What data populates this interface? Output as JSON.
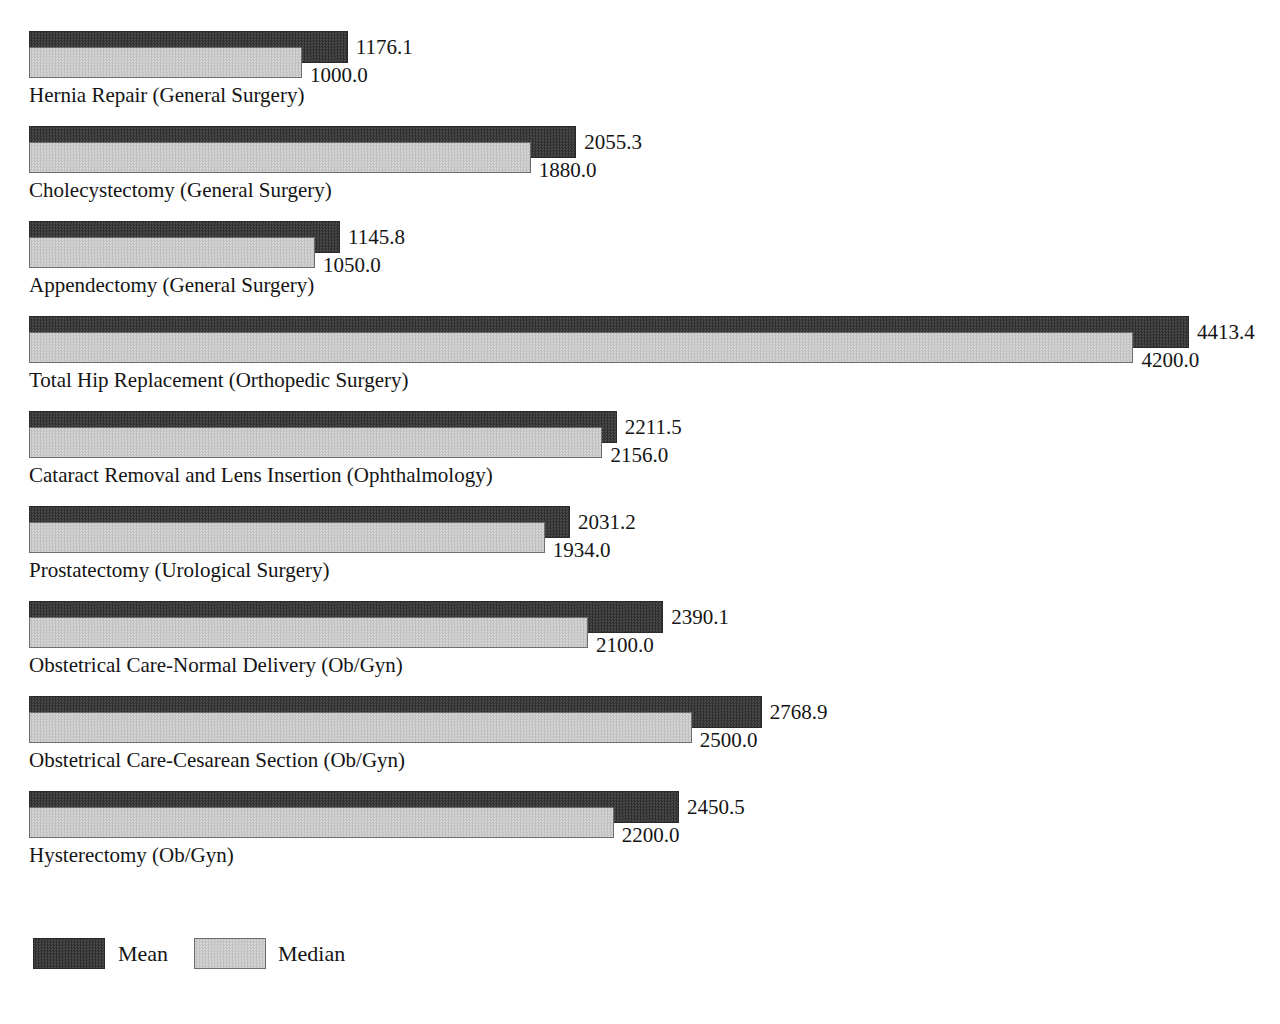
{
  "chart_data": {
    "type": "bar",
    "orientation": "horizontal",
    "title": "Mean and Median Charges",
    "subtitle": "",
    "xlabel": "",
    "ylabel": "",
    "grid": false,
    "legend_position": "bottom-left",
    "xlim": [
      0,
      4413.4
    ],
    "categories": [
      "Hernia Repair (General Surgery)",
      "Cholecystectomy (General Surgery)",
      "Appendectomy (General Surgery)",
      "Total Hip Replacement (Orthopedic Surgery)",
      "Cataract Removal and Lens Insertion (Ophthalmology)",
      "Prostatectomy (Urological Surgery)",
      "Obstetrical Care-Normal Delivery (Ob/Gyn)",
      "Obstetrical Care-Cesarean Section (Ob/Gyn)",
      "Hysterectomy (Ob/Gyn)"
    ],
    "series": [
      {
        "name": "Mean",
        "color": "#3b3b3b",
        "values": [
          1176.1,
          2055.3,
          1145.8,
          4413.4,
          2211.5,
          2031.2,
          2390.1,
          2768.9,
          2450.5
        ],
        "labels": [
          "1176.1",
          "2055.3",
          "1145.8",
          "4413.4",
          "2211.5",
          "2031.2",
          "2390.1",
          "2768.9",
          "2450.5"
        ]
      },
      {
        "name": "Median",
        "color": "#c9c9c9",
        "values": [
          1000.0,
          1880.0,
          1050.0,
          4200.0,
          2156.0,
          1934.0,
          2100.0,
          2500.0,
          2200.0
        ],
        "labels": [
          "1000.0",
          "1880.0",
          "1050.0",
          "4200.0",
          "2156.0",
          "1934.0",
          "2100.0",
          "2500.0",
          "2200.0"
        ]
      }
    ]
  },
  "legend": {
    "mean_label": "Mean",
    "median_label": "Median"
  },
  "geometry": {
    "bar_origin_x": 29,
    "px_per_unit": 0.2598,
    "scale_offset_px": 13.3,
    "first_group_top": 31,
    "group_pitch": 95,
    "label_gap": 8
  }
}
